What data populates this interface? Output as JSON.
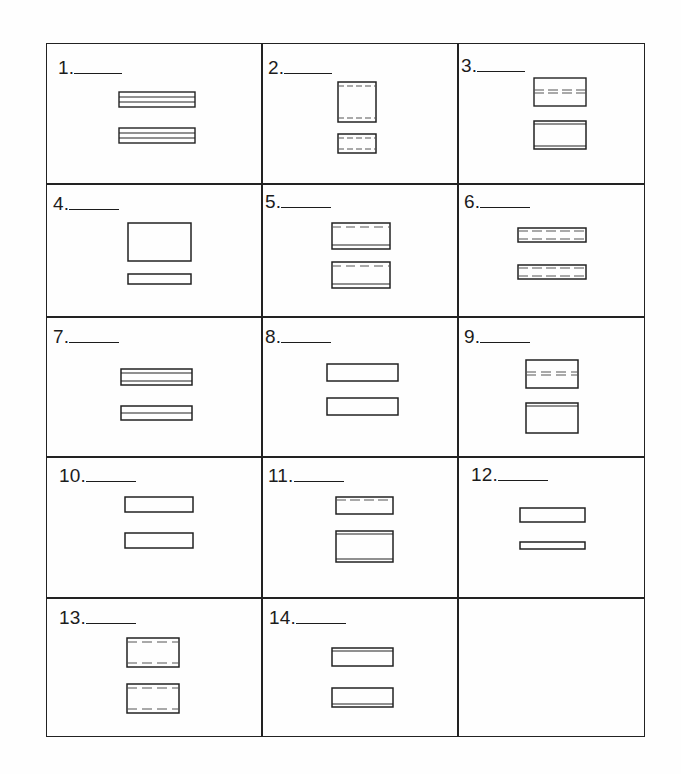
{
  "worksheet": {
    "columns": 3,
    "rows": 5,
    "problems": [
      {
        "number": "1.",
        "blank": "______",
        "figure": "two long thin boxes, each divided by two horizontal lines into three bands"
      },
      {
        "number": "2.",
        "blank": "______",
        "figure": "tall box and small box, both with dashed lines near top and bottom"
      },
      {
        "number": "3.",
        "blank": "______",
        "figure": "box with double dashed line across middle; box with double solid lines at top and bottom"
      },
      {
        "number": "4.",
        "blank": "______",
        "figure": "large plain box above long thin plain box"
      },
      {
        "number": "5.",
        "blank": "______",
        "figure": "two boxes each with dashed line near top and solid line near bottom"
      },
      {
        "number": "6.",
        "blank": "______",
        "figure": "two thin boxes each with dashed lines near top and bottom"
      },
      {
        "number": "7.",
        "blank": "______",
        "figure": "thin box with two interior lines; thin box with one interior line"
      },
      {
        "number": "8.",
        "blank": "______",
        "figure": "two plain equal boxes"
      },
      {
        "number": "9.",
        "blank": "______",
        "figure": "box with double dashed line across middle; box with double solid line at top"
      },
      {
        "number": "10.",
        "blank": "______",
        "figure": "two plain equal boxes"
      },
      {
        "number": "11.",
        "blank": "______",
        "figure": "short box with dashed line near top; taller box with solid lines at top and bottom"
      },
      {
        "number": "12.",
        "blank": "______",
        "figure": "plain box above thinner plain box"
      },
      {
        "number": "13.",
        "blank": "______",
        "figure": "two boxes each with dashed lines near top and bottom"
      },
      {
        "number": "14.",
        "blank": "______",
        "figure": "box with solid line near top; box with solid line near bottom"
      },
      {
        "number": "",
        "blank": "",
        "figure": "empty cell"
      }
    ]
  },
  "colors": {
    "line": "#222222",
    "text": "#1c1c1c",
    "paper": "#fefefe"
  }
}
